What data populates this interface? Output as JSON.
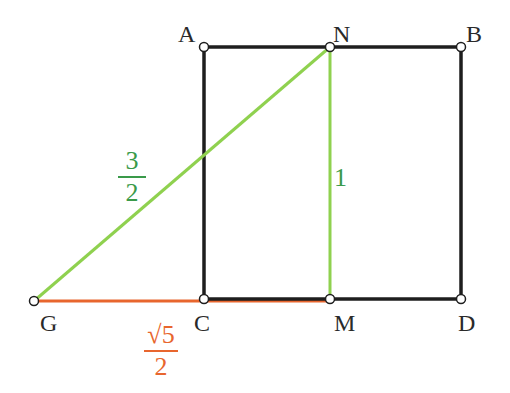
{
  "diagram": {
    "type": "geometric-construction",
    "colors": {
      "square": "#1e1e1e",
      "green": "#8fd14f",
      "green_text": "#3a9a4a",
      "orange": "#e8662e",
      "point_fill": "#ffffff"
    },
    "points": [
      {
        "id": "A",
        "label": "A",
        "x": 204,
        "y": 47
      },
      {
        "id": "N",
        "label": "N",
        "x": 330,
        "y": 47
      },
      {
        "id": "B",
        "label": "B",
        "x": 461,
        "y": 47
      },
      {
        "id": "C",
        "label": "C",
        "x": 204,
        "y": 299
      },
      {
        "id": "M",
        "label": "M",
        "x": 330,
        "y": 299
      },
      {
        "id": "D",
        "label": "D",
        "x": 461,
        "y": 299
      },
      {
        "id": "G",
        "label": "G",
        "x": 34,
        "y": 301
      }
    ],
    "segments": [
      {
        "from": "A",
        "to": "B",
        "color": "square"
      },
      {
        "from": "B",
        "to": "D",
        "color": "square"
      },
      {
        "from": "C",
        "to": "D",
        "color": "square"
      },
      {
        "from": "A",
        "to": "C",
        "color": "square"
      },
      {
        "from": "N",
        "to": "M",
        "color": "green"
      },
      {
        "from": "G",
        "to": "N",
        "color": "green"
      },
      {
        "from": "G",
        "to": "M",
        "color": "orange"
      }
    ],
    "measures": {
      "gn": {
        "numerator": "3",
        "denominator": "2"
      },
      "nm": {
        "value": "1"
      },
      "gc": {
        "numerator": "√5",
        "denominator": "2"
      }
    }
  }
}
